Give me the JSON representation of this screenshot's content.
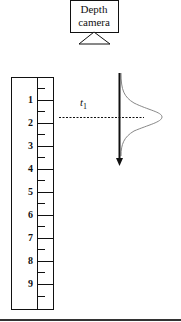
{
  "camera": {
    "label_line1": "Depth",
    "label_line2": "camera"
  },
  "ruler": {
    "labels": [
      "1",
      "2",
      "3",
      "4",
      "5",
      "6",
      "7",
      "8",
      "9"
    ]
  },
  "measurement": {
    "time_label": "t",
    "time_subscript": "1"
  },
  "colors": {
    "stroke": "#111111",
    "curve": "#888888",
    "background": "#ffffff"
  }
}
